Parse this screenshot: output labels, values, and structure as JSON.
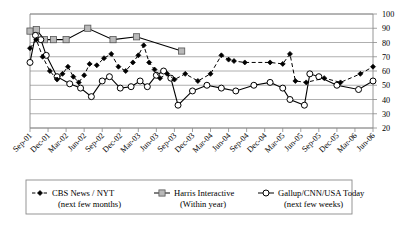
{
  "chart_data": {
    "type": "line",
    "title": "",
    "xlabel": "",
    "ylabel": "",
    "ylim": [
      20,
      100
    ],
    "ytick_step": 10,
    "yticks": [
      20,
      30,
      40,
      50,
      60,
      70,
      80,
      90,
      100
    ],
    "ytick_side": "right",
    "grid": true,
    "legend_position": "bottom",
    "categories": [
      "Sep-01",
      "Dec-01",
      "Mar-02",
      "Jun-02",
      "Sep-02",
      "Dec-02",
      "Mar-03",
      "Jun-03",
      "Sep-03",
      "Dec-03",
      "Mar-04",
      "Jun-04",
      "Sep-04",
      "Dec-04",
      "Mar-05",
      "Jun-05",
      "Sep-05",
      "Dec-05",
      "Mar-06",
      "Jun-06"
    ],
    "x_start": "Sep-01",
    "x_end": "Jun-06",
    "series": [
      {
        "name": "CBS News / NYT",
        "sublabel": "(next few months)",
        "marker": "diamond",
        "line_style": "dashed",
        "points": [
          {
            "x": 0.0,
            "y": 76
          },
          {
            "x": 0.35,
            "y": 82
          },
          {
            "x": 0.7,
            "y": 70
          },
          {
            "x": 1.1,
            "y": 60
          },
          {
            "x": 1.5,
            "y": 54
          },
          {
            "x": 1.8,
            "y": 58
          },
          {
            "x": 2.1,
            "y": 63
          },
          {
            "x": 2.4,
            "y": 56
          },
          {
            "x": 2.7,
            "y": 52
          },
          {
            "x": 3.0,
            "y": 57
          },
          {
            "x": 3.3,
            "y": 65
          },
          {
            "x": 3.7,
            "y": 64
          },
          {
            "x": 4.1,
            "y": 69
          },
          {
            "x": 4.5,
            "y": 72
          },
          {
            "x": 4.9,
            "y": 63
          },
          {
            "x": 5.3,
            "y": 60
          },
          {
            "x": 5.7,
            "y": 66
          },
          {
            "x": 6.0,
            "y": 71
          },
          {
            "x": 6.3,
            "y": 78
          },
          {
            "x": 6.6,
            "y": 66
          },
          {
            "x": 6.9,
            "y": 61
          },
          {
            "x": 7.2,
            "y": 55
          },
          {
            "x": 7.6,
            "y": 58
          },
          {
            "x": 8.0,
            "y": 54
          },
          {
            "x": 8.6,
            "y": 58
          },
          {
            "x": 9.3,
            "y": 53
          },
          {
            "x": 10.0,
            "y": 58
          },
          {
            "x": 10.6,
            "y": 71
          },
          {
            "x": 11.0,
            "y": 68
          },
          {
            "x": 11.3,
            "y": 67
          },
          {
            "x": 11.9,
            "y": 66
          },
          {
            "x": 13.3,
            "y": 66
          },
          {
            "x": 14.0,
            "y": 65
          },
          {
            "x": 14.4,
            "y": 72
          },
          {
            "x": 14.7,
            "y": 53
          },
          {
            "x": 15.3,
            "y": 52
          },
          {
            "x": 16.3,
            "y": 55
          },
          {
            "x": 17.2,
            "y": 52
          },
          {
            "x": 18.3,
            "y": 58
          },
          {
            "x": 19.0,
            "y": 63
          }
        ]
      },
      {
        "name": "Harris Interactive",
        "sublabel": "(Within year)",
        "marker": "square",
        "line_style": "solid",
        "points": [
          {
            "x": 0.0,
            "y": 88
          },
          {
            "x": 0.35,
            "y": 89
          },
          {
            "x": 0.8,
            "y": 82
          },
          {
            "x": 1.3,
            "y": 82
          },
          {
            "x": 2.0,
            "y": 82
          },
          {
            "x": 3.2,
            "y": 90
          },
          {
            "x": 4.6,
            "y": 82
          },
          {
            "x": 5.9,
            "y": 84
          },
          {
            "x": 8.4,
            "y": 74
          }
        ]
      },
      {
        "name": "Gallup/CNN/USA Today",
        "sublabel": "(next few weeks)",
        "marker": "circle",
        "line_style": "solid",
        "points": [
          {
            "x": 0.0,
            "y": 66
          },
          {
            "x": 0.3,
            "y": 85
          },
          {
            "x": 0.6,
            "y": 82
          },
          {
            "x": 0.9,
            "y": 71
          },
          {
            "x": 1.5,
            "y": 56
          },
          {
            "x": 2.2,
            "y": 51
          },
          {
            "x": 2.8,
            "y": 48
          },
          {
            "x": 3.4,
            "y": 42
          },
          {
            "x": 4.0,
            "y": 53
          },
          {
            "x": 4.4,
            "y": 56
          },
          {
            "x": 5.0,
            "y": 48
          },
          {
            "x": 5.6,
            "y": 49
          },
          {
            "x": 6.1,
            "y": 53
          },
          {
            "x": 6.5,
            "y": 49
          },
          {
            "x": 7.0,
            "y": 57
          },
          {
            "x": 7.4,
            "y": 60
          },
          {
            "x": 7.8,
            "y": 55
          },
          {
            "x": 8.2,
            "y": 36
          },
          {
            "x": 9.0,
            "y": 46
          },
          {
            "x": 9.8,
            "y": 50
          },
          {
            "x": 10.6,
            "y": 48
          },
          {
            "x": 11.4,
            "y": 46
          },
          {
            "x": 12.4,
            "y": 50
          },
          {
            "x": 13.3,
            "y": 52
          },
          {
            "x": 14.0,
            "y": 48
          },
          {
            "x": 14.4,
            "y": 40
          },
          {
            "x": 15.2,
            "y": 36
          },
          {
            "x": 15.5,
            "y": 58
          },
          {
            "x": 16.0,
            "y": 56
          },
          {
            "x": 17.0,
            "y": 50
          },
          {
            "x": 18.2,
            "y": 47
          },
          {
            "x": 19.0,
            "y": 53
          }
        ]
      }
    ]
  },
  "legend": [
    {
      "label": "CBS News / NYT",
      "sublabel": "(next few months)",
      "marker": "diamond",
      "line_style": "dashed"
    },
    {
      "label": "Harris Interactive",
      "sublabel": "(Within year)",
      "marker": "square",
      "line_style": "solid"
    },
    {
      "label": "Gallup/CNN/USA Today",
      "sublabel": "(next few weeks)",
      "marker": "circle",
      "line_style": "solid"
    }
  ],
  "caption": "",
  "colors": {
    "line": "#000000",
    "grid": "#9a9a9a",
    "frame": "#8a8a8a",
    "square_fill": "#b9b9b9",
    "circle_fill": "#ffffff",
    "text": "#000000"
  }
}
